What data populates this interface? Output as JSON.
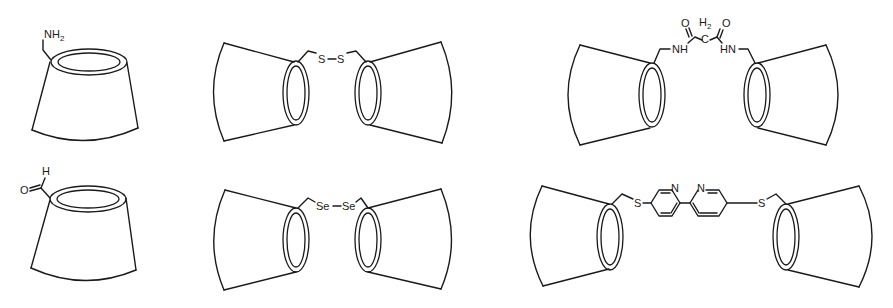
{
  "figure": {
    "structures": [
      {
        "id": "amino-cd",
        "labels": {
          "group": "NH",
          "subscript": "2"
        }
      },
      {
        "id": "aldehyde-cd",
        "labels": {
          "oxygen": "O",
          "hydrogen": "H"
        }
      },
      {
        "id": "disulfide-dimer",
        "labels": {
          "s1": "S",
          "s2": "S"
        }
      },
      {
        "id": "diselenide-dimer",
        "labels": {
          "se1": "Se",
          "se2": "Se"
        }
      },
      {
        "id": "malonamide-dimer",
        "labels": {
          "o1": "O",
          "o2": "O",
          "ch2_h": "H",
          "ch2_sub": "2",
          "ch2_c": "C",
          "nh_left": "NH",
          "nh_right": "HN"
        }
      },
      {
        "id": "bipyridine-dimer",
        "labels": {
          "s1": "S",
          "s2": "S",
          "n1": "N",
          "n2": "N"
        }
      }
    ]
  }
}
